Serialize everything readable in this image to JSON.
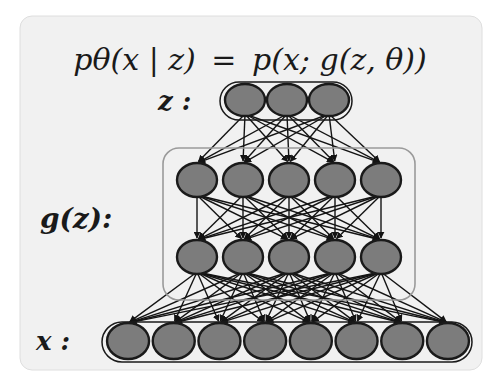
{
  "title": {
    "formula_lhs": "pθ(x | z)",
    "formula_eq": "=",
    "formula_rhs": "p(x; g(z, θ))"
  },
  "layers": {
    "latent": {
      "label": "z :",
      "node_count": 3
    },
    "generator": {
      "label": "g(z):",
      "hidden_layers": 2,
      "nodes_per_layer": 5
    },
    "observed": {
      "label": "x :",
      "node_count": 8
    }
  },
  "colors": {
    "panel_fill": "#f1f1f1",
    "panel_border": "#d8d8d8",
    "node_fill": "#7c7c7c",
    "node_stroke": "#1a1a1a",
    "edge": "#141414",
    "group_box": "#9a9a9a"
  }
}
